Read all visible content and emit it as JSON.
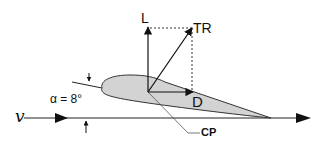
{
  "diagram": {
    "type": "airfoil-force-diagram",
    "labels": {
      "lift": "L",
      "total_reaction": "TR",
      "drag": "D",
      "angle_of_attack": "α = 8°",
      "velocity": "v",
      "center_of_pressure": "CP"
    },
    "angle_of_attack_deg": 8,
    "colors": {
      "airfoil_fill": "#d3d3d3",
      "stroke": "#111111",
      "dashed": "#333333",
      "leader": "#555555"
    }
  }
}
